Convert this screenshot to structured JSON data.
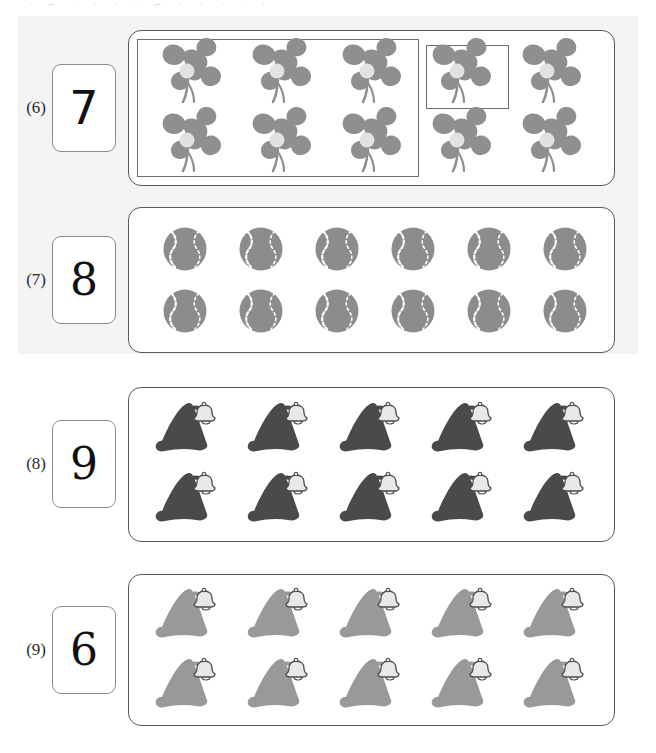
{
  "page": {
    "cut_off_top_text": "· ⌐ · · · · ⌐ · · · · ·",
    "background_color": "#ffffff",
    "band_color": "#f4f4f4"
  },
  "colors": {
    "clover": "#8f8f8f",
    "clover_center": "#e2e2e2",
    "ball": "#8c8c8c",
    "ball_seam": "#ffffff",
    "hat_dark": "#4a4a4a",
    "hat_light": "#999999",
    "bell": "#e8e8e8",
    "outline": "#595959",
    "inner_outline": "#6e6e6e",
    "box_outline": "#8c8c8c",
    "digit": "#111111",
    "label": "#2b2b2b"
  },
  "exercises": [
    {
      "label": "(6)",
      "answer": "7",
      "object": "four-leaf-clover",
      "object_color": "#8f8f8f",
      "total_count": 10,
      "columns": 5,
      "rows": 2,
      "grouping": {
        "big_box_items": 6,
        "big_box_columns": 3,
        "small_box_items": 1,
        "has_inner_boxes": true
      },
      "banded": true
    },
    {
      "label": "(7)",
      "answer": "8",
      "object": "tennis-ball",
      "object_color": "#8c8c8c",
      "total_count": 12,
      "columns": 6,
      "rows": 2,
      "grouping": {
        "has_inner_boxes": false
      },
      "banded": true
    },
    {
      "label": "(8)",
      "answer": "9",
      "object": "santa-hat-dark",
      "object_color": "#4a4a4a",
      "total_count": 10,
      "columns": 5,
      "rows": 2,
      "grouping": {
        "has_inner_boxes": false
      },
      "banded": false
    },
    {
      "label": "(9)",
      "answer": "6",
      "object": "santa-hat-light",
      "object_color": "#999999",
      "total_count": 10,
      "columns": 5,
      "rows": 2,
      "grouping": {
        "has_inner_boxes": false
      },
      "banded": false
    }
  ]
}
